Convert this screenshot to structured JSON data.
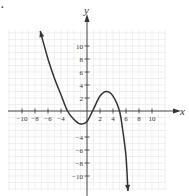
{
  "figure": {
    "marker": "."
  },
  "chart_data": {
    "type": "line",
    "title": "",
    "xlabel": "x",
    "ylabel": "y",
    "xlim": [
      -12,
      12
    ],
    "ylim": [
      -12,
      12
    ],
    "grid": true,
    "x_ticks": [
      -10,
      -8,
      -6,
      -4,
      2,
      4,
      6,
      8,
      10
    ],
    "x_tick_labels": [
      "−10",
      "−8",
      "−6",
      "−4",
      "2",
      "4",
      "6",
      "8",
      "10"
    ],
    "y_ticks": [
      10,
      8,
      6,
      4,
      2,
      -4,
      -6,
      -8,
      -10
    ],
    "y_tick_labels": [
      "10",
      "8",
      "6",
      "4",
      "2",
      "−4",
      "−6",
      "−8",
      "−10"
    ],
    "series": [
      {
        "name": "f(x)",
        "description": "Cubic-shaped curve with arrows at both ends; crosses x-axis near -3, 1, and 5; local minimum near (-1, -2); local maximum near (3, 3)",
        "x": [
          -7.2,
          -6,
          -5,
          -4,
          -3,
          -2,
          -1,
          0,
          1,
          2,
          3,
          4,
          5,
          5.5,
          6,
          6.3
        ],
        "y": [
          12.3,
          8,
          5,
          2.5,
          0,
          -1.3,
          -2,
          -1.6,
          0.3,
          2.3,
          3,
          2.3,
          0,
          -3,
          -7,
          -12.3
        ]
      }
    ],
    "legend": null
  },
  "style": {
    "curve_color": "#333333",
    "axis_color": "#333333",
    "grid_color": "#e6e6e6"
  }
}
